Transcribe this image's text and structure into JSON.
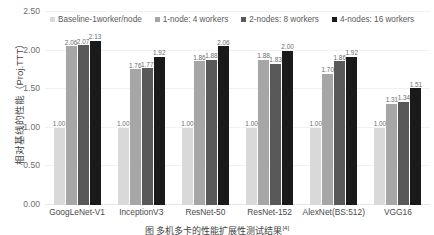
{
  "chart_data": {
    "type": "bar",
    "title": "",
    "xlabel": "",
    "ylabel": "相对基线的性能（Proj.TTT）",
    "ylim": [
      0,
      2.5
    ],
    "yticks": [
      "0.00",
      "0.50",
      "1.00",
      "1.50",
      "2.00",
      "2.50"
    ],
    "ytick_values": [
      0,
      0.5,
      1.0,
      1.5,
      2.0,
      2.5
    ],
    "grid": true,
    "legend_position": "top",
    "categories": [
      "GoogLeNet-V1",
      "InceptionV3",
      "ResNet-50",
      "ResNet-152",
      "AlexNet(BS:512)",
      "VGG16"
    ],
    "series": [
      {
        "name": "Baseline-1worker/node",
        "color": "#d9d9d9",
        "values": [
          1.0,
          1.0,
          1.0,
          1.0,
          1.0,
          1.0
        ],
        "labels": [
          "1.00",
          "1.00",
          "1.00",
          "1.00",
          "1.00",
          "1.00"
        ]
      },
      {
        "name": "1-node: 4 workers",
        "color": "#a6a6a6",
        "values": [
          2.06,
          1.76,
          1.86,
          1.88,
          1.7,
          1.31
        ],
        "labels": [
          "2.06",
          "1.76",
          "1.86",
          "1.88",
          "1.70",
          "1.31"
        ]
      },
      {
        "name": "2-nodes: 8 workers",
        "color": "#595959",
        "values": [
          2.07,
          1.77,
          1.88,
          1.83,
          1.86,
          1.34
        ],
        "labels": [
          "2.07",
          "1.77",
          "1.88",
          "1.83",
          "1.86",
          "1.34"
        ]
      },
      {
        "name": "4-nodes: 16 workers",
        "color": "#1a1a1a",
        "values": [
          2.13,
          1.92,
          2.06,
          2.0,
          1.92,
          1.51
        ],
        "labels": [
          "2.13",
          "1.92",
          "2.06",
          "2.00",
          "1.92",
          "1.51"
        ]
      }
    ]
  },
  "caption": {
    "text": "图  多机多卡的性能扩展性测试结果",
    "citation": "[4]"
  }
}
